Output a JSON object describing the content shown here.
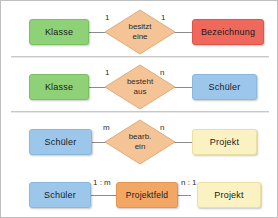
{
  "diagram": {
    "colors": {
      "green": "#8fd177",
      "red": "#f0675c",
      "blue": "#9cc7ea",
      "yellow": "#fbf2c4",
      "orange": "#f2a765",
      "diamond": "#f5c496",
      "line": "#8a8a8a",
      "separator": "#c9c9c9",
      "background": "#ffffff"
    },
    "rows": [
      {
        "id": "row-1",
        "left_entity": "Klasse",
        "left_cardinality": "1",
        "relationship_line1": "besitzt",
        "relationship_line2": "eine",
        "right_cardinality": "1",
        "right_entity": "Bezeichnung"
      },
      {
        "id": "row-2",
        "left_entity": "Klasse",
        "left_cardinality": "1",
        "relationship_line1": "besteht",
        "relationship_line2": "aus",
        "right_cardinality": "n",
        "right_entity": "Schüler"
      },
      {
        "id": "row-3",
        "left_entity": "Schüler",
        "left_cardinality": "m",
        "relationship_line1": "bearb.",
        "relationship_line2": "ein",
        "right_cardinality": "n",
        "right_entity": "Projekt"
      },
      {
        "id": "row-4",
        "left_entity": "Schüler",
        "left_cardinality": "1 : m",
        "relationship_box": "Projektfeld",
        "right_cardinality": "n : 1",
        "right_entity": "Projekt"
      }
    ]
  }
}
